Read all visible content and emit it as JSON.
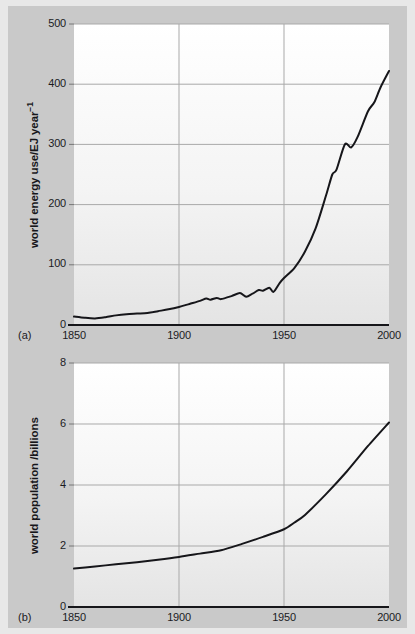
{
  "figure": {
    "background_color": "#c9c9c9",
    "outer_color": "#e8e8e8",
    "line_color": "#16161a",
    "grid_color": "#a8a8a8"
  },
  "panel_a": {
    "tag": "(a)",
    "ylabel_main": "world energy use",
    "ylabel_unit_a": "/EJ year",
    "ylabel_unit_sup": "−1",
    "yticks": [
      "0",
      "100",
      "200",
      "300",
      "400",
      "500"
    ],
    "xticks": [
      "1850",
      "1900",
      "1950",
      "2000"
    ]
  },
  "panel_b": {
    "tag": "(b)",
    "ylabel_main": "world population",
    "ylabel_unit_a": " /billions",
    "ylabel_unit_sup": "",
    "yticks": [
      "0",
      "2",
      "4",
      "6",
      "8"
    ],
    "xticks": [
      "1850",
      "1900",
      "1950",
      "2000"
    ]
  },
  "chart_data": [
    {
      "type": "line",
      "id": "world-energy-use",
      "title": "",
      "panel": "(a)",
      "xlabel": "",
      "ylabel": "world energy use/EJ year−1",
      "xlim": [
        1850,
        2000
      ],
      "ylim": [
        0,
        500
      ],
      "xticks": [
        1850,
        1900,
        1950,
        2000
      ],
      "yticks": [
        0,
        100,
        200,
        300,
        400,
        500
      ],
      "grid": true,
      "legend": "none",
      "x": [
        1850,
        1855,
        1860,
        1865,
        1870,
        1875,
        1880,
        1885,
        1890,
        1895,
        1900,
        1905,
        1910,
        1913,
        1915,
        1918,
        1920,
        1925,
        1929,
        1932,
        1935,
        1938,
        1940,
        1943,
        1945,
        1948,
        1950,
        1955,
        1960,
        1965,
        1970,
        1973,
        1975,
        1979,
        1982,
        1985,
        1990,
        1993,
        1996,
        2000
      ],
      "values": [
        14,
        12,
        11,
        13,
        16,
        18,
        19,
        20,
        23,
        26,
        30,
        35,
        40,
        44,
        42,
        45,
        43,
        48,
        53,
        47,
        52,
        58,
        57,
        62,
        55,
        70,
        78,
        95,
        122,
        160,
        215,
        250,
        258,
        300,
        295,
        312,
        355,
        370,
        395,
        422
      ]
    },
    {
      "type": "line",
      "id": "world-population",
      "title": "",
      "panel": "(b)",
      "xlabel": "",
      "ylabel": "world population /billions",
      "xlim": [
        1850,
        2000
      ],
      "ylim": [
        0,
        8
      ],
      "xticks": [
        1850,
        1900,
        1950,
        2000
      ],
      "yticks": [
        0,
        2,
        4,
        6,
        8
      ],
      "grid": true,
      "legend": "none",
      "x": [
        1850,
        1860,
        1870,
        1880,
        1890,
        1900,
        1910,
        1920,
        1930,
        1940,
        1950,
        1955,
        1960,
        1970,
        1980,
        1990,
        2000
      ],
      "values": [
        1.26,
        1.33,
        1.4,
        1.47,
        1.55,
        1.64,
        1.75,
        1.86,
        2.07,
        2.3,
        2.55,
        2.77,
        3.02,
        3.7,
        4.45,
        5.28,
        6.05
      ]
    }
  ]
}
